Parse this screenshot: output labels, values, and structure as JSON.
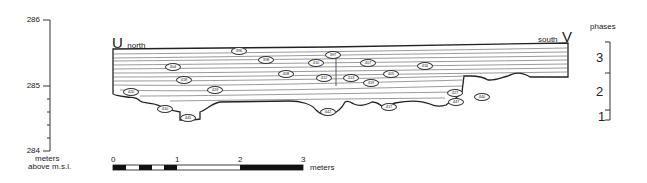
{
  "figure": {
    "type": "archaeological stratigraphic section",
    "left_end": {
      "letter": "U",
      "direction": "north"
    },
    "right_end": {
      "letter": "V",
      "direction": "south"
    }
  },
  "elevation_axis": {
    "ticks": [
      {
        "label": "286",
        "y": 20
      },
      {
        "label": "285",
        "y": 86
      },
      {
        "label": "284",
        "y": 151
      }
    ],
    "unit_line1": "meters",
    "unit_line2": "above m.s.l."
  },
  "phases": {
    "title": "phases",
    "items": [
      {
        "label": "3"
      },
      {
        "label": "2"
      },
      {
        "label": "1"
      }
    ]
  },
  "scale_bar": {
    "ticks": [
      "0",
      "1",
      "2",
      "3"
    ],
    "unit": "meters"
  },
  "layer_labels": [
    {
      "id": "396",
      "x": 238,
      "y": 50
    },
    {
      "id": "397",
      "x": 332,
      "y": 54
    },
    {
      "id": "398",
      "x": 265,
      "y": 59
    },
    {
      "id": "404",
      "x": 172,
      "y": 66
    },
    {
      "id": "410",
      "x": 315,
      "y": 62
    },
    {
      "id": "407",
      "x": 367,
      "y": 62
    },
    {
      "id": "416",
      "x": 424,
      "y": 65
    },
    {
      "id": "408",
      "x": 285,
      "y": 73
    },
    {
      "id": "405",
      "x": 390,
      "y": 73
    },
    {
      "id": "418",
      "x": 183,
      "y": 79
    },
    {
      "id": "412",
      "x": 323,
      "y": 77
    },
    {
      "id": "413",
      "x": 350,
      "y": 77
    },
    {
      "id": "419",
      "x": 370,
      "y": 82
    },
    {
      "id": "420",
      "x": 130,
      "y": 91
    },
    {
      "id": "423",
      "x": 214,
      "y": 89
    },
    {
      "id": "427",
      "x": 454,
      "y": 92
    },
    {
      "id": "440",
      "x": 481,
      "y": 96
    },
    {
      "id": "447",
      "x": 455,
      "y": 101
    },
    {
      "id": "410",
      "x": 164,
      "y": 108
    },
    {
      "id": "445",
      "x": 187,
      "y": 117
    },
    {
      "id": "442",
      "x": 327,
      "y": 111
    },
    {
      "id": "417",
      "x": 388,
      "y": 106
    }
  ]
}
